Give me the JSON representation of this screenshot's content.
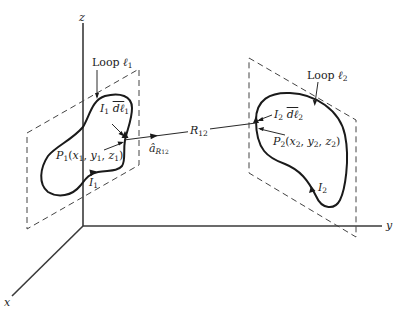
{
  "diagram": {
    "type": "3D vector field geometry - two current loops",
    "colors": {
      "background": "#ffffff",
      "lines": "#1a1a1a",
      "text": "#222222"
    },
    "axes": {
      "z_label": "z",
      "y_label": "y",
      "x_label": "x"
    },
    "loop1": {
      "label_text": "Loop ",
      "label_symbol": "ℓ",
      "label_sub": "1",
      "current_element": {
        "current": "I",
        "current_sub": "1",
        "dl": "dℓ",
        "dl_sub": "1"
      },
      "point": {
        "name": "P",
        "name_sub": "1",
        "open": "(",
        "x": "x",
        "x_sub": "1",
        "y": "y",
        "y_sub": "1",
        "z": "z",
        "z_sub": "1",
        "close": ")",
        "sep": ", "
      },
      "current_label": "I",
      "current_label_sub": "1"
    },
    "loop2": {
      "label_text": "Loop ",
      "label_symbol": "ℓ",
      "label_sub": "2",
      "current_element": {
        "current": "I",
        "current_sub": "2",
        "dl": "dℓ",
        "dl_sub": "2"
      },
      "point": {
        "name": "P",
        "name_sub": "2",
        "open": "(",
        "x": "x",
        "x_sub": "2",
        "y": "y",
        "y_sub": "2",
        "z": "z",
        "z_sub": "2",
        "close": ")",
        "sep": ", "
      },
      "current_label": "I",
      "current_label_sub": "2"
    },
    "separation": {
      "R": "R",
      "R_sub": "12",
      "unit_vector": "â",
      "unit_vector_sub_main": "R",
      "unit_vector_sub_sub": "12"
    }
  }
}
